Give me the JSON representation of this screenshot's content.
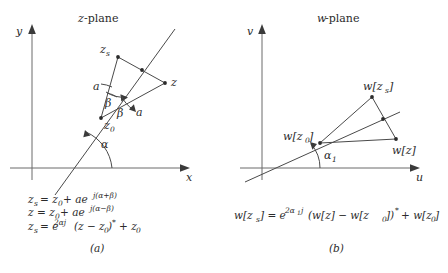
{
  "figure": {
    "panels": [
      {
        "id": "z-plane",
        "title": "z-plane",
        "title_italic_part": "z",
        "title_roman_part": "-plane",
        "axis_x_label": "x",
        "axis_y_label": "y",
        "caption": "(a)",
        "points": [
          {
            "name": "z_s",
            "label_base": "z",
            "label_sub": "s"
          },
          {
            "name": "z",
            "label_base": "z",
            "label_sub": ""
          },
          {
            "name": "z_0",
            "label_base": "z",
            "label_sub": "0"
          }
        ],
        "angle_labels": [
          "α",
          "β",
          "β"
        ],
        "length_labels": [
          "a",
          "a"
        ],
        "equations": [
          {
            "lhs": "z",
            "lhs_sub": "s",
            "body": "= z₀ + ae",
            "exponent": "j(α+β)"
          },
          {
            "lhs": "z",
            "lhs_sub": "",
            "body": "= z₀ + ae",
            "exponent": "j(α−β)"
          },
          {
            "lhs": "z",
            "lhs_sub": "s",
            "body": "= e",
            "exponent": "2αj",
            "tail": "(z − z₀)* + z₀"
          }
        ]
      },
      {
        "id": "w-plane",
        "title": "w-plane",
        "title_italic_part": "w",
        "title_roman_part": "-plane",
        "axis_x_label": "u",
        "axis_y_label": "v",
        "caption": "(b)",
        "points": [
          {
            "name": "w_zs",
            "label": "w[z_s]"
          },
          {
            "name": "w_z",
            "label": "w[z]"
          },
          {
            "name": "w_z0",
            "label": "w[z_0]"
          }
        ],
        "angle_labels": [
          "α₁"
        ],
        "equations": [
          {
            "full": "w[z_s] = e^{2α₁j} (w[z] − w[z₀])* + w[z₀]"
          }
        ]
      }
    ],
    "colors": {
      "line": "#4a4a4a",
      "axis": "#6a6a6a",
      "text": "#2b2b2b",
      "background": "#ffffff"
    },
    "labels": {
      "z_plane_title_italic": "z",
      "z_plane_title_rest": "-plane",
      "w_plane_title_italic": "w",
      "w_plane_title_rest": "-plane",
      "y_axis": "y",
      "x_axis": "x",
      "v_axis": "v",
      "u_axis": "u",
      "zs_base": "z",
      "zs_sub": "s",
      "z_base": "z",
      "z0_base": "z",
      "z0_sub": "0",
      "a1": "a",
      "a2": "a",
      "beta1": "β",
      "beta2": "β",
      "alpha": "α",
      "alpha1_base": "α",
      "alpha1_sub": "1",
      "w_zs": "w[z",
      "w_zs_sub": "s",
      "w_zs_close": "]",
      "w_z": "w[z]",
      "w_z0": "w[z",
      "w_z0_sub": "0",
      "w_z0_close": "]",
      "caption_a": "(a)",
      "caption_b": "(b)",
      "eq1_lhs": "z",
      "eq1_lhs_sub": "s",
      "eq1_rhs": "= z",
      "eq1_rhs_sub": "0",
      "eq1_rhs2": "+ ae",
      "eq1_exp": "j(α+β)",
      "eq2_lhs": "z",
      "eq2_rhs": "= z",
      "eq2_rhs_sub": "0",
      "eq2_rhs2": "+ ae",
      "eq2_exp": "j(α−β)",
      "eq3_lhs": "z",
      "eq3_lhs_sub": "s",
      "eq3_rhs": "= e",
      "eq3_exp": "2αj",
      "eq3_tail": "(z − z",
      "eq3_tail_sub": "0",
      "eq3_tail2": ")",
      "eq3_star": "*",
      "eq3_tail3": "+ z",
      "eq3_tail3_sub": "0",
      "eqw_1": "w[z",
      "eqw_1sub": "s",
      "eqw_2": "] = e",
      "eqw_exp": "2α",
      "eqw_exp_sub": "1",
      "eqw_exp2": "j",
      "eqw_3": "(w[z] − w[z",
      "eqw_3sub": "0",
      "eqw_4": "])",
      "eqw_star": "*",
      "eqw_5": "+ w[z",
      "eqw_5sub": "0",
      "eqw_6": "]"
    }
  }
}
